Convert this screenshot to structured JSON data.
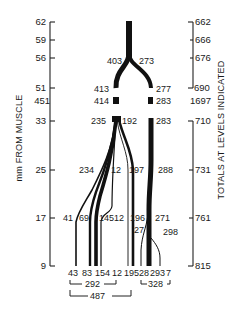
{
  "figure": {
    "left_axis": {
      "label": "mm FROM MUSCLE",
      "ticks": [
        {
          "value": "62",
          "y": 22
        },
        {
          "value": "59",
          "y": 40
        },
        {
          "value": "56",
          "y": 58
        },
        {
          "value": "51",
          "y": 88
        },
        {
          "value": "451",
          "y": 101
        },
        {
          "value": "33",
          "y": 121
        },
        {
          "value": "25",
          "y": 170
        },
        {
          "value": "17",
          "y": 218
        },
        {
          "value": "9",
          "y": 266
        }
      ]
    },
    "right_axis": {
      "label": "TOTALS AT LEVELS INDICATED",
      "ticks": [
        {
          "value": "662",
          "y": 22
        },
        {
          "value": "666",
          "y": 40
        },
        {
          "value": "676",
          "y": 58
        },
        {
          "value": "690",
          "y": 88
        },
        {
          "value": "1697",
          "y": 101
        },
        {
          "value": "710",
          "y": 121
        },
        {
          "value": "731",
          "y": 170
        },
        {
          "value": "761",
          "y": 218
        },
        {
          "value": "815",
          "y": 266
        }
      ]
    },
    "branch_labels": {
      "l403": "403",
      "l273": "273",
      "l413": "413",
      "l277": "277",
      "l414": "414",
      "l283a": "283",
      "l235": "235",
      "l192": "192",
      "l283b": "283",
      "l234": "234",
      "l12a": "12",
      "l197": "197",
      "l288": "288",
      "l41": "41",
      "l69": "69",
      "l145": "145",
      "l12b": "12",
      "l196": "196",
      "l27": "27",
      "l271": "271",
      "l298": "298"
    },
    "bottom_labels": [
      "43",
      "83",
      "154",
      "12",
      "195",
      "28",
      "293",
      "7"
    ],
    "brackets": {
      "b292": "292",
      "b328": "328",
      "b487": "487"
    }
  }
}
